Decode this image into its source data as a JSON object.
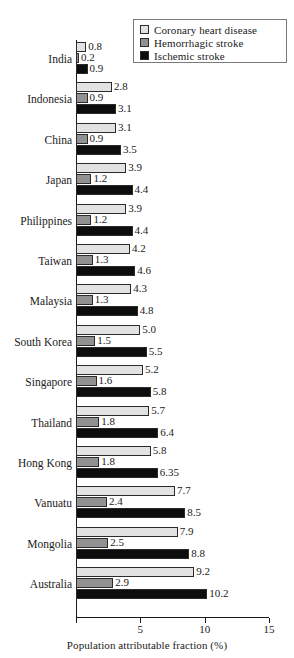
{
  "chart_data": {
    "type": "bar",
    "orientation": "horizontal",
    "title": "",
    "xlabel": "Population attributable fraction (%)",
    "ylabel": "",
    "xlim": [
      0,
      15
    ],
    "xticks": [
      0,
      5,
      10,
      15
    ],
    "xtick_labels": [
      "",
      "5",
      "10",
      "15"
    ],
    "grid": false,
    "legend_position": "top-right",
    "categories": [
      "India",
      "Indonesia",
      "China",
      "Japan",
      "Philippines",
      "Taiwan",
      "Malaysia",
      "South Korea",
      "Singapore",
      "Thailand",
      "Hong Kong",
      "Vanuatu",
      "Mongolia",
      "Australia"
    ],
    "series": [
      {
        "name": "Coronary heart disease",
        "color": "#e2e2e2",
        "values": [
          0.8,
          2.8,
          3.1,
          3.9,
          3.9,
          4.2,
          4.3,
          5.0,
          5.2,
          5.7,
          5.8,
          7.7,
          7.9,
          9.2
        ],
        "labels": [
          "0.8",
          "2.8",
          "3.1",
          "3.9",
          "3.9",
          "4.2",
          "4.3",
          "5.0",
          "5.2",
          "5.7",
          "5.8",
          "7.7",
          "7.9",
          "9.2"
        ]
      },
      {
        "name": "Hemorrhagic stroke",
        "color": "#919191",
        "values": [
          0.2,
          0.9,
          0.9,
          1.2,
          1.2,
          1.3,
          1.3,
          1.5,
          1.6,
          1.8,
          1.8,
          2.4,
          2.5,
          2.9
        ],
        "labels": [
          "0.2",
          "0.9",
          "0.9",
          "1.2",
          "1.2",
          "1.3",
          "1.3",
          "1.5",
          "1.6",
          "1.8",
          "1.8",
          "2.4",
          "2.5",
          "2.9"
        ]
      },
      {
        "name": "Ischemic stroke",
        "color": "#0d0d0d",
        "values": [
          0.9,
          3.1,
          3.5,
          4.4,
          4.4,
          4.6,
          4.8,
          5.5,
          5.8,
          6.4,
          6.35,
          8.5,
          8.8,
          10.2
        ],
        "labels": [
          "0.9",
          "3.1",
          "3.5",
          "4.4",
          "4.4",
          "4.6",
          "4.8",
          "5.5",
          "5.8",
          "6.4",
          "6.35",
          "8.5",
          "8.8",
          "10.2"
        ]
      }
    ]
  },
  "legend": {
    "items": [
      {
        "label": "Coronary heart disease",
        "color": "#e2e2e2"
      },
      {
        "label": "Hemorrhagic stroke",
        "color": "#919191"
      },
      {
        "label": "Ischemic stroke",
        "color": "#0d0d0d"
      }
    ]
  },
  "axis": {
    "x_title": "Population attributable fraction (%)",
    "ticks": [
      {
        "value": 0,
        "label": ""
      },
      {
        "value": 5,
        "label": "5"
      },
      {
        "value": 10,
        "label": "10"
      },
      {
        "value": 15,
        "label": "15"
      }
    ]
  }
}
